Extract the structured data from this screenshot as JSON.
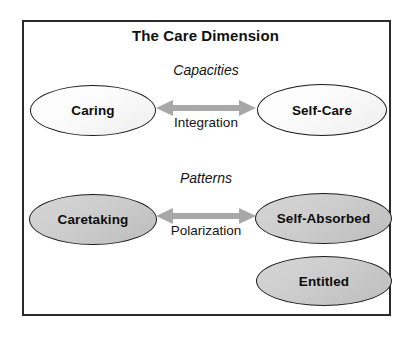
{
  "diagram": {
    "title": "The Care Dimension",
    "bands": [
      {
        "id": "capacities",
        "label": "Capacities",
        "relation": "Integration",
        "left_node": "Caring",
        "right_nodes": [
          "Self-Care"
        ],
        "fill": "light"
      },
      {
        "id": "patterns",
        "label": "Patterns",
        "relation": "Polarization",
        "left_node": "Caretaking",
        "right_nodes": [
          "Self-Absorbed",
          "Entitled"
        ],
        "fill": "gray"
      }
    ],
    "nodes": {
      "caring": "Caring",
      "self_care": "Self-Care",
      "caretaking": "Caretaking",
      "self_absorbed": "Self-Absorbed",
      "entitled": "Entitled"
    },
    "labels": {
      "capacities": "Capacities",
      "patterns": "Patterns",
      "integration": "Integration",
      "polarization": "Polarization"
    },
    "icons": {
      "integration_arrow": "double-headed-arrow-icon",
      "polarization_arrow": "double-headed-arrow-icon"
    },
    "colors": {
      "frame_border": "#2b2b2b",
      "ellipse_border": "#1a1a1a",
      "light_fill": "#f7f7f7",
      "gray_fill": "#cccccc",
      "arrow": "#a8a8a8",
      "text": "#0d0d0d",
      "background": "#ffffff"
    }
  }
}
